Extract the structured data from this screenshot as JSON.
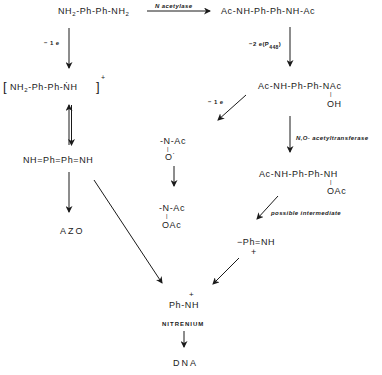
{
  "diagram": {
    "title": "",
    "nodes": {
      "benzidine": {
        "text_a": "NH",
        "sub_a": "2",
        "text_b": "-Ph-Ph-NH",
        "sub_b": "2"
      },
      "diacetyl": {
        "text": "Ac-NH-Ph-Ph-NH-Ac"
      },
      "radical_cation": {
        "text_a": "NH",
        "sub_a": "2",
        "text_b": "-Ph-Ph-ṄH",
        "bracket_open": "[",
        "bracket_close": "]",
        "charge": "+"
      },
      "hydroxamic": {
        "text": "Ac-NH-Ph-Ph-NAc",
        "bond": "|",
        "substituent": "OH"
      },
      "diimine": {
        "text": "NH=Ph=Ph=NH"
      },
      "nitroxide": {
        "text": "-N-Ac",
        "bond": "|",
        "substituent": "O˙"
      },
      "acetoxy_amide": {
        "text": "-N-Ac",
        "bond": "|",
        "substituent": "OAc"
      },
      "acetoxy_amine": {
        "text": "Ac-NH-Ph-Ph-NH",
        "bond": "|",
        "substituent": "OAc"
      },
      "azo": {
        "text": "AZO"
      },
      "iminium": {
        "text": "−Ph=NH",
        "charge": "+"
      },
      "nitrenium_ion": {
        "text": "Ph-NH",
        "charge": "+"
      },
      "nitrenium_label": {
        "text": "NITRENIUM"
      },
      "dna": {
        "text": "DNA"
      }
    },
    "edge_labels": {
      "n_acetylase": "N  acetylase",
      "minus_1e_left": "− 1 e",
      "minus_2e_p448": "−2 e(P",
      "p448_sub": "448",
      "p448_close": ")",
      "minus_1e_right": "− 1 e",
      "no_acetyltransferase": "N,O- acetyltransferase",
      "possible_intermediate": "possible  intermediate"
    },
    "edges": [
      {
        "from": "benzidine",
        "to": "diacetyl",
        "label": "N acetylase"
      },
      {
        "from": "benzidine",
        "to": "radical_cation",
        "label": "-1e"
      },
      {
        "from": "radical_cation",
        "to": "diimine",
        "type": "equilibrium"
      },
      {
        "from": "diacetyl",
        "to": "hydroxamic",
        "label": "-2e(P448)"
      },
      {
        "from": "hydroxamic",
        "to": "nitroxide",
        "label": "-1e"
      },
      {
        "from": "hydroxamic",
        "to": "acetoxy_amine",
        "label": "N,O- acetyltransferase"
      },
      {
        "from": "nitroxide",
        "to": "acetoxy_amide"
      },
      {
        "from": "diimine",
        "to": "azo"
      },
      {
        "from": "diimine",
        "to": "nitrenium_ion"
      },
      {
        "from": "acetoxy_amine",
        "to": "iminium",
        "label": "possible intermediate"
      },
      {
        "from": "iminium",
        "to": "nitrenium_ion"
      },
      {
        "from": "nitrenium_ion",
        "to": "dna"
      }
    ]
  }
}
